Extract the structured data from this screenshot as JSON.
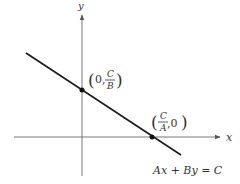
{
  "diagram": {
    "type": "coordinate-graph",
    "colors": {
      "axis": "#555555",
      "line": "#1a1a1a",
      "point": "#111111",
      "text": "#333333",
      "background": "#ffffff"
    },
    "axes": {
      "x_label": "x",
      "y_label": "y"
    },
    "equation": "Ax + By = C",
    "points": [
      {
        "name": "y-intercept",
        "open": "(",
        "first": "0,",
        "frac_num": "C",
        "frac_den": "B",
        "second": "",
        "close": ")"
      },
      {
        "name": "x-intercept",
        "open": "(",
        "first": "",
        "frac_num": "C",
        "frac_den": "A",
        "second": ",0",
        "close": ")"
      }
    ]
  }
}
